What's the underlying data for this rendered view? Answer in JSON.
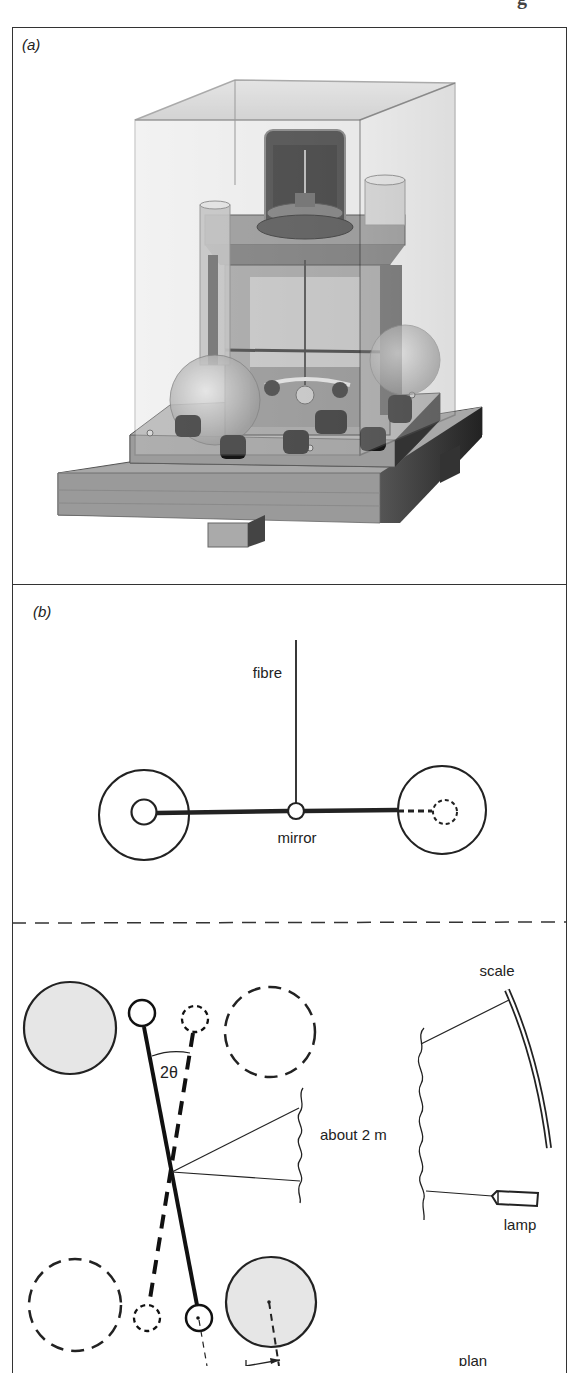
{
  "page": {
    "header_fragment": "g",
    "figure_frame": true
  },
  "panels": [
    {
      "id": "a",
      "label": "(a)",
      "type": "photograph",
      "subject": "Cavendish torsion balance apparatus in glass case on wooden base"
    },
    {
      "id": "b",
      "label": "(b)",
      "type": "elevation-diagram",
      "labels": {
        "fibre": "fibre",
        "mirror": "mirror"
      }
    },
    {
      "id": "plan",
      "label": "plan",
      "type": "plan-diagram",
      "labels": {
        "angle": "2θ",
        "distance": "about 2 m",
        "scale": "scale",
        "lamp": "lamp",
        "view": "plan"
      }
    }
  ],
  "colors": {
    "ink": "#1a1a1a",
    "line": "#222222",
    "shaded_sphere": "#e6e6e6",
    "background": "#ffffff"
  }
}
